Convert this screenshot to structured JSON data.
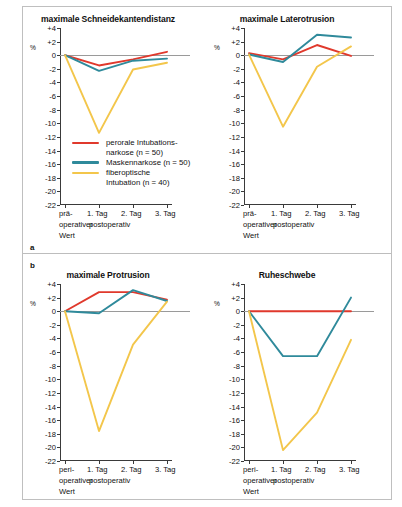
{
  "figure": {
    "panel_a_label": "a",
    "panel_b_label": "b",
    "y_axis_label": "%",
    "y_ticks": [
      "+4",
      "+2",
      "0",
      "-2",
      "-4",
      "-6",
      "-8",
      "-10",
      "-12",
      "-14",
      "-16",
      "-18",
      "-20",
      "-22"
    ],
    "y_tick_values": [
      4,
      2,
      0,
      -2,
      -4,
      -6,
      -8,
      -10,
      -12,
      -14,
      -16,
      -18,
      -20,
      -22
    ],
    "x_tick_labels_top": [
      "prä-",
      "1. Tag",
      "2. Tag",
      "3. Tag"
    ],
    "x_tick_labels_bottom": [
      "peri-",
      "1. Tag",
      "2. Tag",
      "3. Tag"
    ],
    "x_caption_top_line1": "prä-",
    "x_caption_top_line2": "operativer",
    "x_caption_top_line3": "Wert",
    "x_caption_bottom_line1": "peri-",
    "x_caption_bottom_line2": "operativer",
    "x_caption_bottom_line3": "Wert",
    "x_caption_post": "postoperativ"
  },
  "legend": {
    "items": [
      {
        "label_line1": "perorale Intubations-",
        "label_line2": "narkose (n = 50)",
        "color": "#e0392c",
        "name": "perorale-intubationsnarkose"
      },
      {
        "label_line1": "Maskennarkose (n = 50)",
        "label_line2": "",
        "color": "#2f8a9b",
        "name": "maskennarkose"
      },
      {
        "label_line1": "fiberoptische",
        "label_line2": "Intubation (n = 40)",
        "color": "#f3c64b",
        "name": "fiberoptische-intubation"
      }
    ]
  },
  "colors": {
    "red": "#e0392c",
    "teal": "#2f8a9b",
    "yellow": "#f3c64b",
    "axis": "#3a3a3a",
    "zero": "#9a9a9a",
    "frame": "#bfbfbf"
  },
  "chart_data": [
    {
      "type": "line",
      "id": "schneidekantendistanz",
      "title": "maximale Schneidekantendistanz",
      "xlabel": "postoperativ",
      "ylabel": "%",
      "categories": [
        "prä-operativer Wert",
        "1. Tag",
        "2. Tag",
        "3. Tag"
      ],
      "ylim": [
        -22,
        4
      ],
      "grid": false,
      "legend_position": "inside-lower-left",
      "series": [
        {
          "name": "perorale Intubationsnarkose (n = 50)",
          "color": "#e0392c",
          "values": [
            0,
            -1.5,
            -0.6,
            0.5
          ]
        },
        {
          "name": "Maskennarkose (n = 50)",
          "color": "#2f8a9b",
          "values": [
            0,
            -2.3,
            -0.8,
            -0.5
          ]
        },
        {
          "name": "fiberoptische Intubation (n = 40)",
          "color": "#f3c64b",
          "values": [
            0,
            -11.4,
            -2.1,
            -1.1
          ]
        }
      ]
    },
    {
      "type": "line",
      "id": "laterotrusion",
      "title": "maximale Laterotrusion",
      "xlabel": "postoperativ",
      "ylabel": "%",
      "categories": [
        "prä-operativer Wert",
        "1. Tag",
        "2. Tag",
        "3. Tag"
      ],
      "ylim": [
        -22,
        4
      ],
      "grid": false,
      "legend_position": "none",
      "series": [
        {
          "name": "perorale Intubationsnarkose (n = 50)",
          "color": "#e0392c",
          "values": [
            0.3,
            -0.6,
            1.5,
            -0.1
          ]
        },
        {
          "name": "Maskennarkose (n = 50)",
          "color": "#2f8a9b",
          "values": [
            0.1,
            -1.0,
            3.0,
            2.6
          ]
        },
        {
          "name": "fiberoptische Intubation (n = 40)",
          "color": "#f3c64b",
          "values": [
            0.1,
            -10.5,
            -1.7,
            1.3
          ]
        }
      ]
    },
    {
      "type": "line",
      "id": "protrusion",
      "title": "maximale Protrusion",
      "xlabel": "postoperativ",
      "ylabel": "%",
      "categories": [
        "peri-operativer Wert",
        "1. Tag",
        "2. Tag",
        "3. Tag"
      ],
      "ylim": [
        -22,
        4
      ],
      "grid": false,
      "legend_position": "none",
      "series": [
        {
          "name": "perorale Intubationsnarkose (n = 50)",
          "color": "#e0392c",
          "values": [
            0,
            2.8,
            2.8,
            1.7
          ]
        },
        {
          "name": "Maskennarkose (n = 50)",
          "color": "#2f8a9b",
          "values": [
            0,
            -0.3,
            3.1,
            1.5
          ]
        },
        {
          "name": "fiberoptische Intubation (n = 40)",
          "color": "#f3c64b",
          "values": [
            0,
            -17.6,
            -4.9,
            1.4
          ]
        }
      ]
    },
    {
      "type": "line",
      "id": "ruheschwebe",
      "title": "Ruheschwebe",
      "xlabel": "postoperativ",
      "ylabel": "%",
      "categories": [
        "peri-operativer Wert",
        "1. Tag",
        "2. Tag",
        "3. Tag"
      ],
      "ylim": [
        -22,
        4
      ],
      "grid": false,
      "legend_position": "none",
      "series": [
        {
          "name": "perorale Intubationsnarkose (n = 50)",
          "color": "#e0392c",
          "values": [
            0,
            0,
            0,
            0
          ]
        },
        {
          "name": "Maskennarkose (n = 50)",
          "color": "#2f8a9b",
          "values": [
            0,
            -6.6,
            -6.6,
            2.0
          ]
        },
        {
          "name": "fiberoptische Intubation (n = 40)",
          "color": "#f3c64b",
          "values": [
            0,
            -20.4,
            -14.9,
            -4.2
          ]
        }
      ]
    }
  ]
}
